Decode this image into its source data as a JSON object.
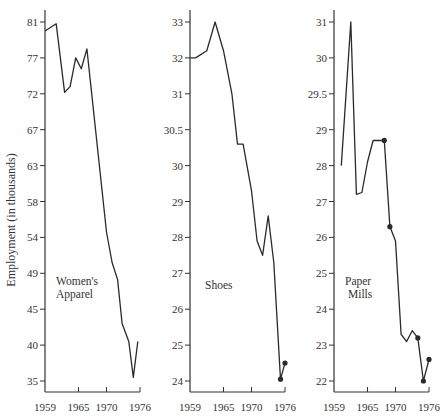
{
  "figure": {
    "ylabel": "Employment (in thousands)",
    "x_ticks": [
      "1959",
      "1965",
      "1970",
      "1976"
    ],
    "line_color": "#2a2a2a",
    "axis_color": "#333333"
  },
  "chart_data": [
    {
      "type": "line",
      "title": "Women's Apparel",
      "label_lines": [
        "Women's",
        "Apparel"
      ],
      "xlabel": "",
      "ylabel": "Employment (in thousands)",
      "x_tick_labels": [
        "1959",
        "1965",
        "1970",
        "1976"
      ],
      "y_tick_labels": [
        "81",
        "77",
        "72",
        "67",
        "63",
        "58",
        "54",
        "49",
        "45",
        "40",
        "35"
      ],
      "xlim": [
        1959,
        1976
      ],
      "ylim": [
        35,
        81
      ],
      "grid": false,
      "x": [
        1959,
        1961,
        1962.5,
        1963.5,
        1964.5,
        1965.5,
        1966.5,
        1970,
        1971,
        1972,
        1972.8,
        1974,
        1974.8,
        1975.6
      ],
      "values": [
        80,
        80.8,
        72.2,
        73,
        77,
        75.5,
        78,
        54.6,
        50.5,
        48.3,
        43,
        40.5,
        35.5,
        40.5
      ],
      "markers": []
    },
    {
      "type": "line",
      "title": "Shoes",
      "label_lines": [
        "Shoes"
      ],
      "xlabel": "",
      "ylabel": "",
      "x_tick_labels": [
        "1959",
        "1965",
        "1970",
        "1976"
      ],
      "y_tick_labels": [
        "33",
        "32",
        "31",
        "30.5",
        "30",
        "29",
        "28",
        "27",
        "26",
        "25",
        "24"
      ],
      "xlim": [
        1959,
        1976
      ],
      "ylim": [
        24,
        33
      ],
      "grid": false,
      "x": [
        1959,
        1960,
        1962,
        1963.5,
        1965,
        1966.5,
        1967.5,
        1968.5,
        1970,
        1971,
        1972,
        1973,
        1974,
        1975.2,
        1976
      ],
      "values": [
        32,
        32,
        32.2,
        33,
        32.2,
        31,
        30.3,
        30.3,
        29.3,
        27.9,
        27.5,
        28.6,
        27.3,
        24.05,
        24.5
      ],
      "markers": [
        13,
        14
      ]
    },
    {
      "type": "line",
      "title": "Paper Mills",
      "label_lines": [
        "Paper",
        "Mills"
      ],
      "xlabel": "",
      "ylabel": "",
      "x_tick_labels": [
        "1959",
        "1965",
        "1970",
        "1976"
      ],
      "y_tick_labels": [
        "31",
        "30",
        "29.5",
        "29",
        "28",
        "27",
        "26",
        "25",
        "24",
        "23",
        "22"
      ],
      "xlim": [
        1959,
        1976
      ],
      "ylim": [
        22,
        31
      ],
      "grid": false,
      "x": [
        1960.3,
        1962,
        1963,
        1964,
        1965,
        1966,
        1967,
        1968,
        1969,
        1970,
        1971,
        1972,
        1973,
        1974,
        1975,
        1976
      ],
      "values": [
        28,
        31,
        27.2,
        27.25,
        28.1,
        28.7,
        28.7,
        28.7,
        26.3,
        25.9,
        23.3,
        23.1,
        23.4,
        23.2,
        22,
        22.6
      ],
      "markers": [
        7,
        8,
        13,
        14,
        15
      ]
    }
  ]
}
